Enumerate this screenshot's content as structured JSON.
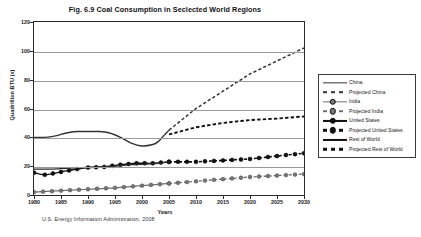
{
  "figure": {
    "title": "Fig. 6.9  Coal Consumption in Seclected World Regions",
    "source_note": "U.S. Energy Information Administration,  2008"
  },
  "axes": {
    "ylabel": "Quadrillion BTU (s)",
    "xlabel": "Years",
    "yticks": [
      "0",
      "20",
      "40",
      "60",
      "80",
      "100",
      "120"
    ],
    "xticks": [
      "1980",
      "1985",
      "1990",
      "1995",
      "2000",
      "2005",
      "2010",
      "2015",
      "2020",
      "2025",
      "2030"
    ]
  },
  "legend": {
    "items": [
      {
        "label": "China",
        "style": "solid-thin",
        "marker": "none",
        "color": "#333333"
      },
      {
        "label": "Projected China",
        "style": "dash-thin",
        "marker": "none",
        "color": "#333333"
      },
      {
        "label": "India",
        "style": "solid-gray",
        "marker": "circle-gray",
        "color": "#6f6f6f"
      },
      {
        "label": "Projected India",
        "style": "dash-gray",
        "marker": "circle-gray",
        "color": "#6f6f6f"
      },
      {
        "label": "United States",
        "style": "solid-thick",
        "marker": "circle-dark",
        "color": "#111111"
      },
      {
        "label": "Projected United States",
        "style": "dash-thick",
        "marker": "circle-dark",
        "color": "#111111"
      },
      {
        "label": "Rest of World",
        "style": "solid-thick",
        "marker": "none",
        "color": "#111111"
      },
      {
        "label": "Projected Rest of World",
        "style": "dash-thick",
        "marker": "none",
        "color": "#111111"
      }
    ]
  },
  "chart_data": {
    "type": "line",
    "title": "Fig. 6.9  Coal Consumption in Seclected World Regions",
    "xlabel": "Years",
    "ylabel": "Quadrillion BTU (s)",
    "xlim": [
      1980,
      2030
    ],
    "ylim": [
      0,
      120
    ],
    "grid": true,
    "legend_position": "right",
    "source": "U.S. Energy Information Administration,  2008",
    "series": [
      {
        "name": "China",
        "kind": "historical",
        "x": [
          1980,
          1982,
          1984,
          1986,
          1988,
          1990,
          1992,
          1994,
          1996,
          1998,
          2000,
          2002,
          2003,
          2004,
          2005
        ],
        "y": [
          40,
          40,
          41,
          43,
          44,
          44,
          44,
          43,
          40,
          36,
          34,
          35,
          37,
          41,
          45
        ]
      },
      {
        "name": "Projected China",
        "kind": "projected",
        "x": [
          2005,
          2010,
          2015,
          2020,
          2025,
          2030
        ],
        "y": [
          45,
          60,
          72,
          84,
          93,
          102
        ]
      },
      {
        "name": "India",
        "kind": "historical",
        "x": [
          1980,
          1985,
          1990,
          1995,
          2000,
          2005
        ],
        "y": [
          2,
          3,
          4,
          5,
          6.5,
          8
        ]
      },
      {
        "name": "Projected India",
        "kind": "projected",
        "x": [
          2005,
          2010,
          2015,
          2020,
          2025,
          2030
        ],
        "y": [
          8,
          9.5,
          11,
          12.5,
          13.5,
          14.5
        ]
      },
      {
        "name": "United States",
        "kind": "historical",
        "x": [
          1980,
          1982,
          1985,
          1988,
          1990,
          1993,
          1996,
          1999,
          2002,
          2005
        ],
        "y": [
          15.5,
          14,
          16,
          18,
          19,
          19.5,
          21,
          22,
          22,
          23
        ]
      },
      {
        "name": "Projected United States",
        "kind": "projected",
        "x": [
          2005,
          2010,
          2015,
          2020,
          2025,
          2030
        ],
        "y": [
          23,
          23,
          24,
          25,
          27,
          29
        ]
      },
      {
        "name": "Rest of World",
        "kind": "historical",
        "x": [
          1980,
          1983,
          1986,
          1989,
          1992,
          1995,
          1998,
          2001,
          2003,
          2005
        ],
        "y": [
          18,
          18,
          18.5,
          19,
          19.5,
          20,
          21,
          21.5,
          22,
          23
        ]
      },
      {
        "name": "Projected Rest of World",
        "kind": "projected",
        "x": [
          2005,
          2010,
          2015,
          2020,
          2025,
          2030
        ],
        "y": [
          42,
          47,
          50,
          52,
          53,
          54.5
        ]
      }
    ]
  }
}
